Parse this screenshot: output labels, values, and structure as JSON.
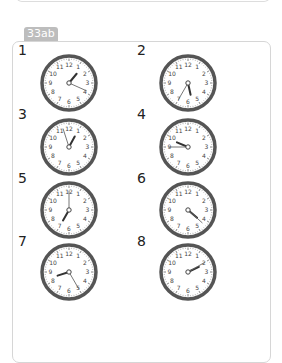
{
  "section_label": "33ab",
  "clocks": [
    {
      "number": "1",
      "hour": 1,
      "minute": 19
    },
    {
      "number": "2",
      "hour": 5,
      "minute": 35
    },
    {
      "number": "3",
      "hour": 12,
      "minute": 57
    },
    {
      "number": "4",
      "hour": 9,
      "minute": 45
    },
    {
      "number": "5",
      "hour": 7,
      "minute": 0
    },
    {
      "number": "6",
      "hour": 4,
      "minute": 22
    },
    {
      "number": "7",
      "hour": 8,
      "minute": 25
    },
    {
      "number": "8",
      "hour": 2,
      "minute": 10
    }
  ],
  "dial_numbers": [
    "12",
    "1",
    "2",
    "3",
    "4",
    "5",
    "6",
    "7",
    "8",
    "9",
    "10",
    "11"
  ],
  "colors": {
    "rim": "#555555",
    "tab_bg": "#bdbdbd",
    "hands": "#333333"
  }
}
